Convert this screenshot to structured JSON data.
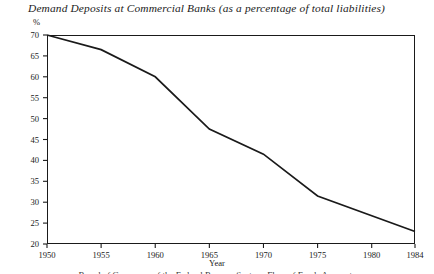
{
  "chart_data": {
    "type": "line",
    "title": "Demand Deposits at Commercial Banks (as a percentage of total liabilities)",
    "xlabel": "Year",
    "ylabel": "%",
    "x": [
      1950,
      1955,
      1960,
      1965,
      1970,
      1975,
      1984
    ],
    "values": [
      70.0,
      66.5,
      60.0,
      47.5,
      41.5,
      31.5,
      23.0
    ],
    "series": [
      {
        "name": "Demand deposits share of total liabilities",
        "values": [
          70.0,
          66.5,
          60.0,
          47.5,
          41.5,
          31.5,
          23.0
        ]
      }
    ],
    "xlim": [
      1950,
      1984
    ],
    "ylim": [
      20,
      70
    ],
    "xticks": [
      1950,
      1955,
      1960,
      1965,
      1970,
      1975,
      1980,
      1984
    ],
    "xtick_labels": [
      "1950",
      "1955",
      "1960",
      "1965",
      "1970",
      "1975",
      "1980",
      "1984"
    ],
    "yticks": [
      20,
      25,
      30,
      35,
      40,
      45,
      50,
      55,
      60,
      65,
      70
    ],
    "ytick_labels": [
      "20",
      "25",
      "30",
      "35",
      "40",
      "45",
      "50",
      "55",
      "60",
      "65",
      "70"
    ],
    "grid": false,
    "legend": "none",
    "line_color": "#1a1a1a"
  },
  "figure": {
    "y_unit": "%",
    "source_caption": "Board of Governors of the Federal Reserve System, Flow of Funds Accounts"
  }
}
